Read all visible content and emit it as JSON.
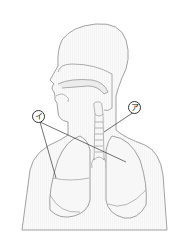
{
  "diagram": {
    "labels": [
      {
        "id": "a",
        "text": "ア",
        "points_to": [
          "trachea/bronchus",
          "right-lung"
        ]
      },
      {
        "id": "i",
        "text": "イ",
        "points_to": [
          "left-lung-lower",
          "right-lung"
        ]
      }
    ]
  },
  "colors": {
    "outline": "#7a7a7a",
    "fill": "#f2f2f2",
    "leader": "#333333"
  }
}
